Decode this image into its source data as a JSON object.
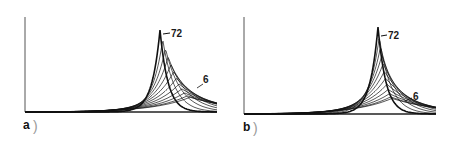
{
  "chart_data": [
    {
      "type": "line",
      "panel": "a",
      "panel_label": "a",
      "title": "",
      "xlabel": "",
      "ylabel": "",
      "grid": false,
      "legend": "none",
      "description": "Family of curves evolving from broad profile (6) to sharp peak (72)",
      "annotations": [
        {
          "text": "72",
          "target": "sharpest peak curve"
        },
        {
          "text": "6",
          "target": "broadest curve"
        }
      ],
      "series_labels": [
        "6",
        "72"
      ],
      "peak_x_fraction": 0.71,
      "n_curves_approx": 12
    },
    {
      "type": "line",
      "panel": "b",
      "panel_label": "b",
      "title": "",
      "xlabel": "",
      "ylabel": "",
      "grid": false,
      "legend": "none",
      "description": "Family of curves evolving from broad profile (6) to sharp peak (72)",
      "annotations": [
        {
          "text": "72",
          "target": "sharpest peak curve"
        },
        {
          "text": "6",
          "target": "broadest curve"
        }
      ],
      "series_labels": [
        "6",
        "72"
      ],
      "peak_x_fraction": 0.71,
      "n_curves_approx": 12
    }
  ],
  "panels": {
    "a": {
      "label": "a",
      "top_annotation": "72",
      "bottom_annotation": "6"
    },
    "b": {
      "label": "b",
      "top_annotation": "72",
      "bottom_annotation": "6"
    }
  }
}
